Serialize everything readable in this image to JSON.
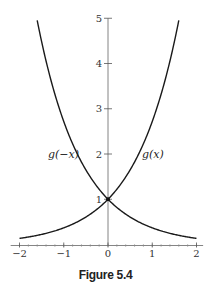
{
  "caption": "Figure 5.4",
  "chart_data": {
    "type": "line",
    "title": "",
    "caption": "Figure 5.4",
    "xlabel": "",
    "ylabel": "",
    "xlim": [
      -2,
      2
    ],
    "ylim": [
      0,
      5
    ],
    "x_ticks": [
      -2,
      -1,
      0,
      1,
      2
    ],
    "x_tick_labels": [
      "−2",
      "−1",
      "0",
      "1",
      "2"
    ],
    "y_ticks": [
      1,
      2,
      3,
      4,
      5
    ],
    "y_tick_labels": [
      "1",
      "2",
      "3",
      "4",
      "5"
    ],
    "grid": false,
    "series": [
      {
        "name": "g(x)",
        "function": "e^x",
        "x": [
          -2,
          -1.5,
          -1,
          -0.5,
          0,
          0.5,
          1,
          1.5,
          1.61
        ],
        "values": [
          0.14,
          0.22,
          0.37,
          0.61,
          1,
          1.65,
          2.72,
          4.48,
          5
        ]
      },
      {
        "name": "g(−x)",
        "function": "e^(-x)",
        "x": [
          -1.61,
          -1.5,
          -1,
          -0.5,
          0,
          0.5,
          1,
          1.5,
          2
        ],
        "values": [
          5,
          4.48,
          2.72,
          1.65,
          1,
          0.61,
          0.37,
          0.22,
          0.14
        ]
      }
    ],
    "annotations": [
      {
        "text": "g(x)",
        "x": 1.1,
        "y": 2
      },
      {
        "text": "g(−x)",
        "x": -1.6,
        "y": 2
      },
      {
        "text": "point",
        "x": 0,
        "y": 1
      }
    ]
  }
}
